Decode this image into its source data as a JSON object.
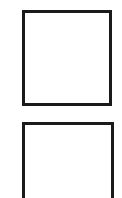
{
  "boxes": [
    {
      "id": "box-1",
      "label": "",
      "border_color": "#1a1a1a",
      "fill_color": "#ffffff"
    },
    {
      "id": "box-2",
      "label": "",
      "border_color": "#1a1a1a",
      "fill_color": "#ffffff"
    }
  ]
}
